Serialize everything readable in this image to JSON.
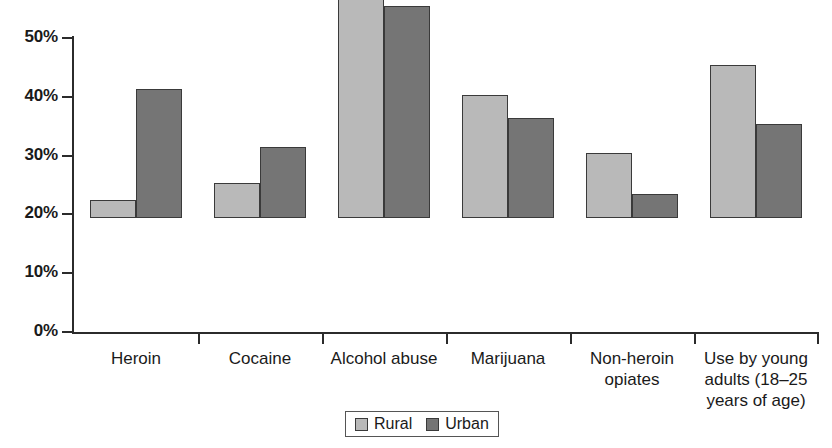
{
  "chart_data": {
    "type": "bar",
    "title": "",
    "subtitle": "",
    "xlabel": "",
    "ylabel": "",
    "grid": false,
    "legend_position": "bottom",
    "ylim": [
      0,
      50
    ],
    "y_tick_labels": [
      "0%",
      "10%",
      "20%",
      "30%",
      "40%",
      "50%"
    ],
    "y_tick_values": [
      0,
      10,
      20,
      30,
      40,
      50
    ],
    "categories": [
      "Heroin",
      "Cocaine",
      "Alcohol abuse",
      "Marijuana",
      "Non-heroin opiates",
      "Use by young adults (18–25 years of age)"
    ],
    "category_label_lines": [
      [
        "Heroin"
      ],
      [
        "Cocaine"
      ],
      [
        "Alcohol abuse"
      ],
      [
        "Marijuana"
      ],
      [
        "Non-heroin",
        "opiates"
      ],
      [
        "Use by young",
        "adults (18–25",
        "years of age)"
      ]
    ],
    "series": [
      {
        "name": "Rural",
        "color": "#b9b9b9",
        "values": [
          3,
          6,
          50,
          21,
          11,
          26
        ]
      },
      {
        "name": "Urban",
        "color": "#757575",
        "values": [
          22,
          12,
          36,
          17,
          4,
          16
        ]
      }
    ]
  },
  "legend": {
    "entries": [
      {
        "label": "Rural",
        "swatch": "rural-swatch"
      },
      {
        "label": "Urban",
        "swatch": "urban-swatch"
      }
    ]
  },
  "colors": {
    "rural": "#b9b9b9",
    "urban": "#757575",
    "axis": "#2b2b2b",
    "bar_border": "#3a3a3a",
    "background": "#ffffff",
    "text": "#1a1a1a"
  }
}
